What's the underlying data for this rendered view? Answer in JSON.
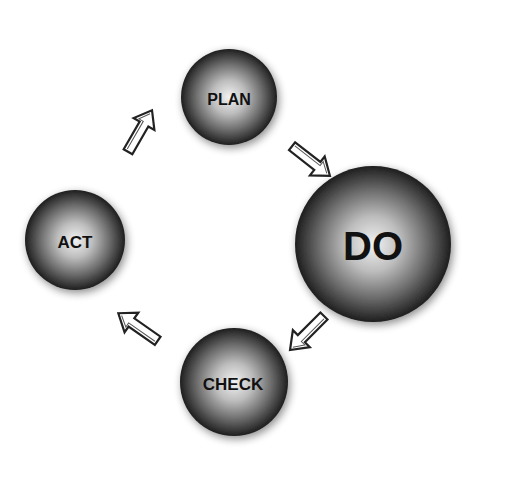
{
  "diagram": {
    "type": "cycle",
    "nodes": [
      {
        "id": "plan",
        "label": "PLAN",
        "cx": 229,
        "cy": 97,
        "r": 48,
        "font_size": 16
      },
      {
        "id": "do",
        "label": "DO",
        "cx": 373,
        "cy": 244,
        "r": 78,
        "font_size": 40
      },
      {
        "id": "check",
        "label": "CHECK",
        "cx": 234,
        "cy": 382,
        "r": 54,
        "font_size": 17
      },
      {
        "id": "act",
        "label": "ACT",
        "cx": 75,
        "cy": 240,
        "r": 50,
        "font_size": 17
      }
    ],
    "edges": [
      {
        "from": "plan",
        "to": "do"
      },
      {
        "from": "do",
        "to": "check"
      },
      {
        "from": "check",
        "to": "act"
      },
      {
        "from": "act",
        "to": "plan"
      }
    ],
    "colors": {
      "sphere_highlight": "#f2f2f2",
      "sphere_mid": "#8a8a8a",
      "sphere_edge": "#1e1e1e",
      "text": "#111111",
      "arrow_stroke": "#222222",
      "arrow_fill": "#ffffff",
      "background": "#ffffff"
    }
  }
}
